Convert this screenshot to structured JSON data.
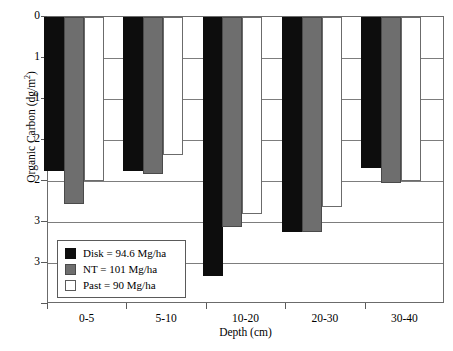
{
  "chart_data": {
    "type": "bar",
    "title": "",
    "xlabel": "Depth (cm)",
    "ylabel": "Organic Carbon (dg/m2)",
    "ylabel_display": "Organic Carbon (dg/m",
    "ylabel_sup": "2",
    "ylabel_tail": ")",
    "categories": [
      "0-5",
      "5-10",
      "10-20",
      "20-30",
      "30-40"
    ],
    "ylim": [
      0,
      3.5
    ],
    "y_inverted": true,
    "grid": true,
    "ytick_values": [
      0,
      0.5,
      1.0,
      1.5,
      2.0,
      2.5,
      3.0,
      3.5
    ],
    "ytick_labels": [
      "0",
      "1",
      "1",
      "2",
      "2",
      "3",
      "3",
      ""
    ],
    "legend_position": "lower-left-inside",
    "series": [
      {
        "name": "Disk",
        "label": "Disk = 94.6 Mg/ha",
        "color": "#0d0d0d",
        "values": [
          1.88,
          1.88,
          3.16,
          2.62,
          1.84
        ]
      },
      {
        "name": "NT",
        "label": "NT = 101 Mg/ha",
        "color": "#6e6e6e",
        "values": [
          2.28,
          1.92,
          2.56,
          2.62,
          2.02
        ]
      },
      {
        "name": "Past",
        "label": "Past = 90 Mg/ha",
        "color": "#ffffff",
        "values": [
          2.0,
          1.68,
          2.4,
          2.32,
          2.0
        ]
      }
    ],
    "legend_entries": [
      {
        "swatch": "disk",
        "text": "Disk = 94.6 Mg/ha"
      },
      {
        "swatch": "nt",
        "text": "NT = 101 Mg/ha"
      },
      {
        "swatch": "past",
        "text": "Past = 90 Mg/ha"
      }
    ]
  }
}
